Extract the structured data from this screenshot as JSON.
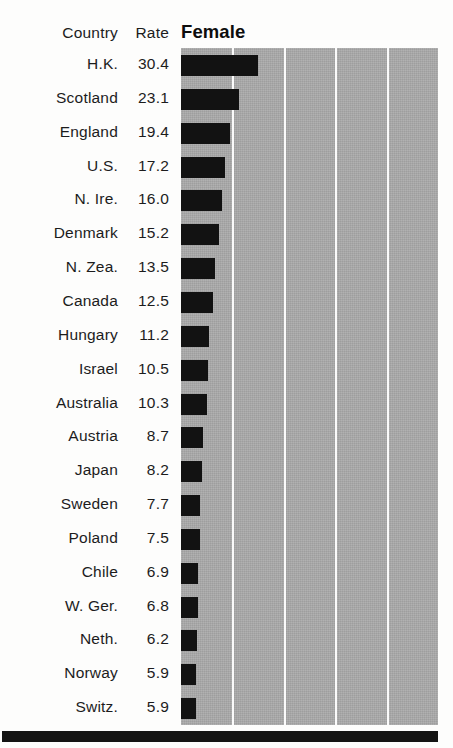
{
  "table": {
    "col_country_header": "Country",
    "col_rate_header": "Rate"
  },
  "chart_data": {
    "type": "bar",
    "orientation": "horizontal",
    "title": "Female",
    "xlabel": "",
    "ylabel": "Country",
    "value_label": "Rate",
    "grid": true,
    "gridlines_x": [
      20.3,
      40.6,
      60.9,
      81.2
    ],
    "xlim": [
      0,
      101.5
    ],
    "legend": "none",
    "categories": [
      "H.K.",
      "Scotland",
      "England",
      "U.S.",
      "N. Ire.",
      "Denmark",
      "N. Zea.",
      "Canada",
      "Hungary",
      "Israel",
      "Australia",
      "Austria",
      "Japan",
      "Sweden",
      "Poland",
      "Chile",
      "W. Ger.",
      "Neth.",
      "Norway",
      "Switz."
    ],
    "values": [
      30.4,
      23.1,
      19.4,
      17.2,
      16.0,
      15.2,
      13.5,
      12.5,
      11.2,
      10.5,
      10.3,
      8.7,
      8.2,
      7.7,
      7.5,
      6.9,
      6.8,
      6.2,
      5.9,
      5.9
    ],
    "value_labels": [
      "30.4",
      "23.1",
      "19.4",
      "17.2",
      "16.0",
      "15.2",
      "13.5",
      "12.5",
      "11.2",
      "10.5",
      "10.3",
      "8.7",
      "8.2",
      "7.7",
      "7.5",
      "6.9",
      "6.8",
      "6.2",
      "5.9",
      "5.9"
    ],
    "colors": {
      "bar": "#121212",
      "plot_background": "#a9a9a9",
      "gridline": "#fbfbfb",
      "text": "#1c1c1c",
      "page_background": "#fdfdfc",
      "footer_rule": "#141414"
    }
  }
}
